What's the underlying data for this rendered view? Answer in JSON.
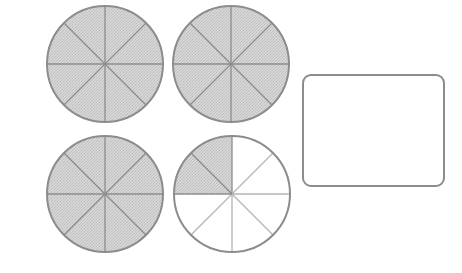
{
  "diagram": {
    "title": "",
    "colors": {
      "shaded_fill": "#d2d2d2",
      "unshaded_fill": "#ffffff",
      "outline": "#8c8c8c",
      "divider_shaded": "#8c8c8c",
      "divider_unshaded": "#b4b4b4"
    },
    "circles": [
      {
        "id": "circle-1",
        "cx": 105,
        "cy": 64,
        "r": 58,
        "parts": 8,
        "shaded_parts": 8,
        "shaded_sectors": [
          0,
          1,
          2,
          3,
          4,
          5,
          6,
          7
        ]
      },
      {
        "id": "circle-2",
        "cx": 231,
        "cy": 64,
        "r": 58,
        "parts": 8,
        "shaded_parts": 8,
        "shaded_sectors": [
          0,
          1,
          2,
          3,
          4,
          5,
          6,
          7
        ]
      },
      {
        "id": "circle-3",
        "cx": 105,
        "cy": 194,
        "r": 58,
        "parts": 8,
        "shaded_parts": 8,
        "shaded_sectors": [
          0,
          1,
          2,
          3,
          4,
          5,
          6,
          7
        ]
      },
      {
        "id": "circle-4",
        "cx": 232,
        "cy": 194,
        "r": 58,
        "parts": 8,
        "shaded_parts": 2,
        "shaded_sectors": [
          6,
          7
        ]
      }
    ],
    "answer_box": {
      "value": "",
      "placeholder": ""
    },
    "total_shaded_parts": 26,
    "parts_per_whole": 8
  }
}
